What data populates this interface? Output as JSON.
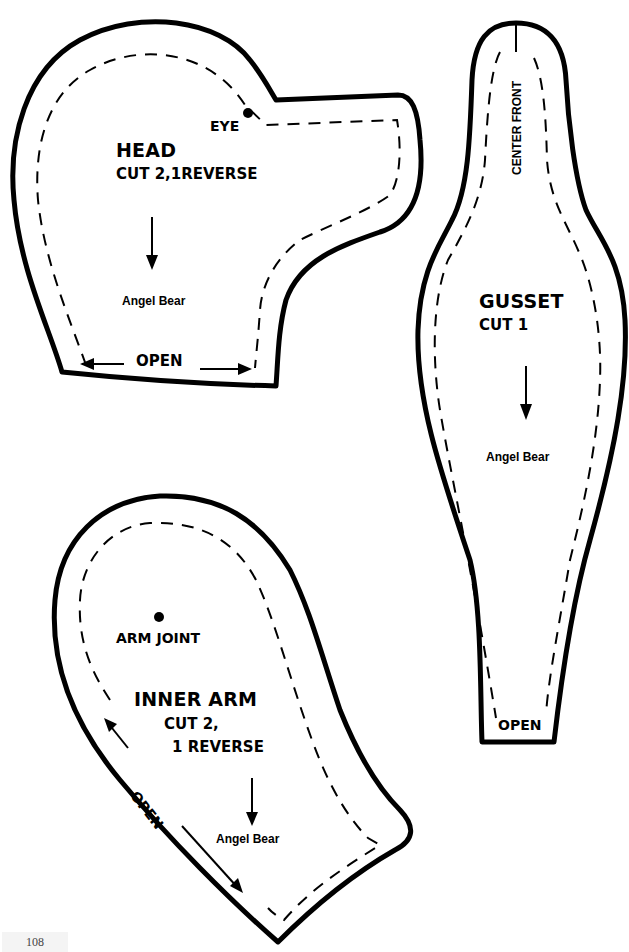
{
  "pieces": {
    "head": {
      "title": "HEAD",
      "cut": "CUT 2,1REVERSE",
      "eye_label": "EYE",
      "brand": "Angel Bear",
      "open_label": "OPEN"
    },
    "gusset": {
      "title": "GUSSET",
      "cut": "CUT 1",
      "center_label": "CENTER FRONT",
      "brand": "Angel Bear",
      "open_label": "OPEN"
    },
    "inner_arm": {
      "title": "INNER ARM",
      "cut_line1": "CUT 2,",
      "cut_line2": "1 REVERSE",
      "joint_label": "ARM JOINT",
      "brand": "Angel Bear",
      "open_label": "OPEN"
    }
  },
  "page_number": "108",
  "colors": {
    "ink": "#000000",
    "paper": "#ffffff"
  }
}
